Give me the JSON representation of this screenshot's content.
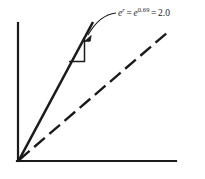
{
  "figure": {
    "background_color": "#ffffff",
    "stroke_color": "#1a1a1a",
    "annotation": {
      "base": "e",
      "exponent_symbol": "r",
      "equals_1": "=",
      "base_2": "e",
      "exponent_value": "0.69",
      "equals_2": "=",
      "result": "2.0",
      "full_text": "e^r = e^0.69 = 2.0"
    },
    "axes": {
      "y_axis": {
        "x": 18,
        "y_top": 23,
        "y_bottom": 161
      },
      "x_axis": {
        "y": 161,
        "x_left": 18,
        "x_right": 176
      }
    },
    "series": [
      {
        "name": "solid-growth-line",
        "style": "solid",
        "from": [
          18,
          161
        ],
        "to": [
          93,
          22
        ]
      },
      {
        "name": "dashed-reference-line",
        "style": "dashed",
        "from": [
          18,
          161
        ],
        "to": [
          168,
          32
        ],
        "dash_pattern": "14 6"
      }
    ],
    "slope_triangle": {
      "name": "slope-triangle",
      "apex": [
        78,
        38
      ],
      "corner": [
        85,
        62
      ],
      "base_left": [
        69,
        62
      ]
    },
    "leader": {
      "name": "curved-leader-arrow",
      "arrow_tip": [
        85,
        41
      ],
      "curve_start": [
        116,
        13
      ],
      "control": [
        99,
        15
      ]
    }
  }
}
